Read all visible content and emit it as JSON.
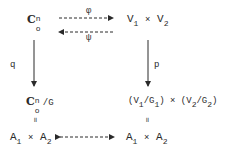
{
  "nodes": {
    "top_left": {
      "base": "C",
      "sup": "n",
      "sub": "o"
    },
    "top_right": {
      "a": "V",
      "a_sub": "1",
      "op": "×",
      "b": "V",
      "b_sub": "2"
    },
    "mid_left": {
      "base": "C",
      "sup": "n",
      "sub": "o",
      "suffix": "/G"
    },
    "mid_right": {
      "p1": "(V",
      "s1": "1",
      "m1": "/G",
      "s2": "1",
      "p2": ") × (V",
      "s3": "2",
      "m2": "/G",
      "s4": "2",
      "p3": ")"
    },
    "bottom_left": {
      "a": "A",
      "a_sub": "1",
      "op": "×",
      "b": "A",
      "b_sub": "2"
    },
    "bottom_right": {
      "a": "A",
      "a_sub": "1",
      "op": "×",
      "b": "A",
      "b_sub": "2"
    }
  },
  "arrows": {
    "phi": {
      "label": "φ",
      "style": "dashed",
      "direction": "right"
    },
    "psi": {
      "label": "ψ",
      "style": "dashed",
      "direction": "left"
    },
    "q": {
      "label": "q",
      "style": "solid",
      "direction": "down"
    },
    "p": {
      "label": "p",
      "style": "solid",
      "direction": "down"
    },
    "bottom": {
      "label": "",
      "style": "dashed",
      "direction": "both"
    }
  },
  "equals_symbol": "॥"
}
